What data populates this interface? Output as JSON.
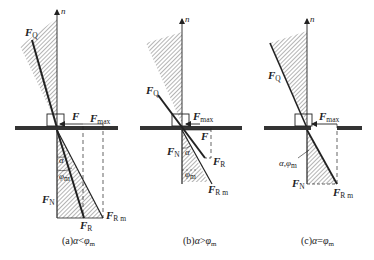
{
  "figure": {
    "panels": [
      {
        "id": "a",
        "caption": "(a)α<φm",
        "caption_parts": {
          "prefix": "(a)",
          "alpha": "α",
          "op": "<",
          "phi": "φ",
          "phi_sub": "m"
        },
        "labels": {
          "n": "n",
          "FQ": {
            "main": "F",
            "sub": "Q"
          },
          "F": {
            "main": "F",
            "sub": ""
          },
          "Fmax": {
            "main": "F",
            "sub": "max"
          },
          "FN": {
            "main": "F",
            "sub": "N"
          },
          "FR": {
            "main": "F",
            "sub": "R"
          },
          "FRm": {
            "main": "F",
            "sub": "R m"
          },
          "alpha": "α",
          "phi": "φ",
          "phi_sub": "m"
        }
      },
      {
        "id": "b",
        "caption": "(b)α>φm",
        "caption_parts": {
          "prefix": "(b)",
          "alpha": "α",
          "op": ">",
          "phi": "φ",
          "phi_sub": "m"
        },
        "labels": {
          "n": "n",
          "FQ": {
            "main": "F",
            "sub": "Q"
          },
          "F": {
            "main": "F",
            "sub": ""
          },
          "Fmax": {
            "main": "F",
            "sub": "max"
          },
          "FN": {
            "main": "F",
            "sub": "N"
          },
          "FR": {
            "main": "F",
            "sub": "R"
          },
          "FRm": {
            "main": "F",
            "sub": "R m"
          },
          "alpha": "α",
          "phi": "φ",
          "phi_sub": "m"
        }
      },
      {
        "id": "c",
        "caption": "(c)α=φm",
        "caption_parts": {
          "prefix": "(c)",
          "alpha": "α",
          "op": "=",
          "phi": "φ",
          "phi_sub": "m"
        },
        "labels": {
          "n": "n",
          "FQ": {
            "main": "F",
            "sub": "Q"
          },
          "Fmax": {
            "main": "F",
            "sub": "max"
          },
          "FN": {
            "main": "F",
            "sub": "N"
          },
          "FRm": {
            "main": "F",
            "sub": "R m"
          },
          "alpha_phi": "α,φ",
          "phi_sub": "m"
        }
      }
    ],
    "colors": {
      "ink": "#222222",
      "ground": "#333333",
      "hatch": "#444444",
      "background": "#ffffff"
    }
  }
}
